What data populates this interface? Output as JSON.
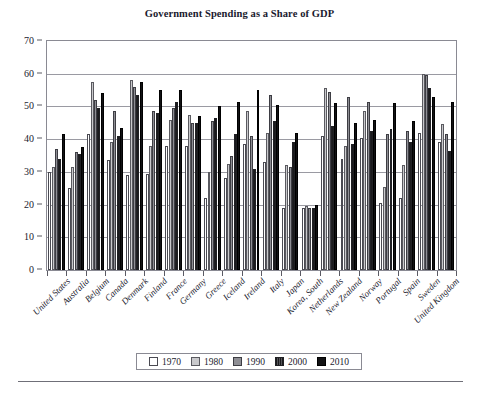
{
  "chart_data": {
    "type": "bar",
    "title": "Government Spending as a Share of GDP",
    "xlabel": "",
    "ylabel": "",
    "ylim": [
      0,
      70
    ],
    "ytick_step": 10,
    "yticks": [
      0,
      10,
      20,
      30,
      40,
      50,
      60,
      70
    ],
    "grid": true,
    "legend_position": "bottom",
    "categories": [
      "United States",
      "Australia",
      "Belgium",
      "Canada",
      "Denmark",
      "Finland",
      "France",
      "Germany",
      "Greece",
      "Iceland",
      "Ireland",
      "Italy",
      "Japan",
      "Korea, South",
      "Netherlands",
      "New Zealand",
      "Norway",
      "Portugal",
      "Spain",
      "Sweden",
      "United Kingdom"
    ],
    "series": [
      {
        "name": "1970",
        "color": "#ffffff",
        "values": [
          30.0,
          25.0,
          41.5,
          33.5,
          29.0,
          29.5,
          38.0,
          38.0,
          22.0,
          28.0,
          38.5,
          33.0,
          19.0,
          19.0,
          41.0,
          34.0,
          40.5,
          20.5,
          22.0,
          42.0,
          39.0
        ]
      },
      {
        "name": "1980",
        "color": "#c9c9cc",
        "values": [
          31.5,
          31.5,
          57.5,
          39.0,
          58.0,
          38.0,
          46.0,
          47.5,
          30.0,
          32.5,
          48.5,
          42.0,
          32.0,
          19.5,
          55.5,
          38.0,
          48.5,
          25.5,
          32.0,
          60.0,
          44.5
        ]
      },
      {
        "name": "1990",
        "color": "#8e8e94",
        "values": [
          37.0,
          36.0,
          52.0,
          48.5,
          56.0,
          48.5,
          49.5,
          45.0,
          45.5,
          35.0,
          41.0,
          53.5,
          31.5,
          19.0,
          54.5,
          53.0,
          51.5,
          41.5,
          42.5,
          59.5,
          41.5
        ]
      },
      {
        "name": "2000",
        "color": "#3a3a3e",
        "values": [
          34.0,
          35.5,
          49.5,
          41.0,
          53.5,
          48.0,
          51.5,
          45.0,
          46.5,
          41.5,
          31.0,
          45.5,
          39.0,
          19.0,
          44.0,
          38.5,
          42.5,
          43.0,
          39.0,
          55.5,
          36.5
        ]
      },
      {
        "name": "2010",
        "color": "#121214",
        "values": [
          41.5,
          37.5,
          54.0,
          43.5,
          57.5,
          55.0,
          55.0,
          47.0,
          50.0,
          51.5,
          55.0,
          50.5,
          42.0,
          20.0,
          51.0,
          45.0,
          46.0,
          51.0,
          45.5,
          53.0,
          51.5
        ]
      }
    ]
  },
  "legend": {
    "items": [
      {
        "label": "1970",
        "swatch_class": "s1970"
      },
      {
        "label": "1980",
        "swatch_class": "s1980"
      },
      {
        "label": "1990",
        "swatch_class": "s1990"
      },
      {
        "label": "2000",
        "swatch_class": "s2000"
      },
      {
        "label": "2010",
        "swatch_class": "s2010"
      }
    ]
  }
}
